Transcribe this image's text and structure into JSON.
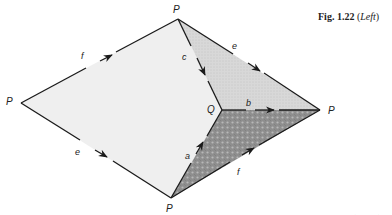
{
  "figure": {
    "caption_number": "Fig. 1.22",
    "caption_open": " (",
    "caption_side": "Left",
    "caption_close": ")",
    "cut_off_caption": "Fig. 1.23 (Right)"
  },
  "vertices": {
    "p_top": "P",
    "p_left": "P",
    "p_right": "P",
    "p_bottom": "P",
    "q": "Q"
  },
  "edges": {
    "top_left": "f",
    "bottom_left": "e",
    "top_right": "e",
    "p_top_to_q": "c",
    "q_to_p_right": "b",
    "p_bottom_to_q": "a",
    "bottom_right": "f"
  },
  "colors": {
    "left_face": "#efefef",
    "top_right_face": "#d6d6d6",
    "bottom_right_face": "#8c8c8c",
    "line": "#1a1a1a"
  }
}
